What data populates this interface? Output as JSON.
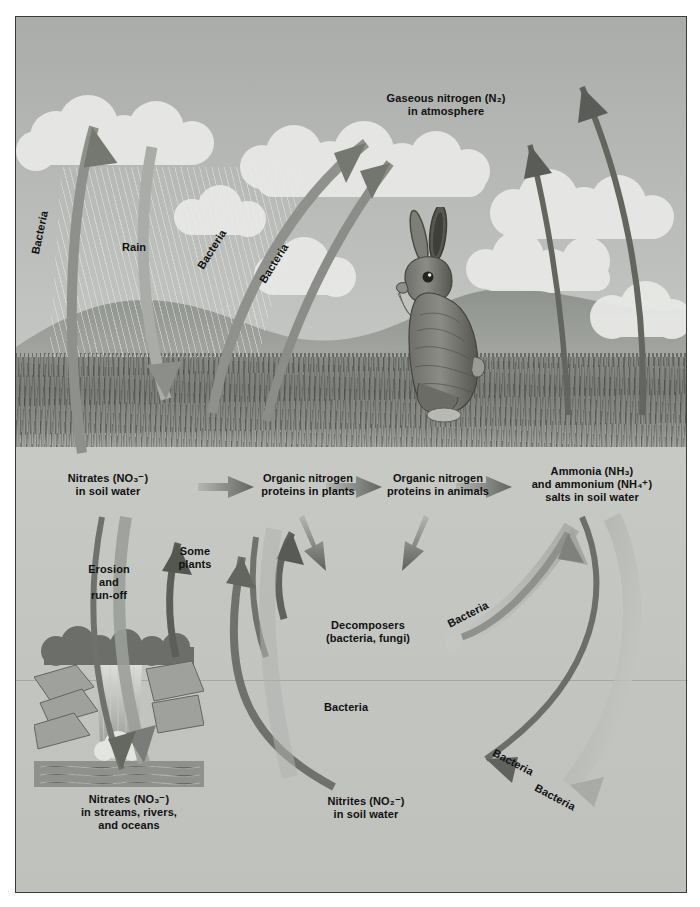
{
  "figure": {
    "background_color": "#bfc2be",
    "border_color": "#3c3c3c"
  },
  "pools": {
    "atmosphere": "Gaseous nitrogen (N₂)\nin atmosphere",
    "nitrates_soil": "Nitrates (NO₃⁻)\nin soil water",
    "organic_plants": "Organic nitrogen\nproteins in plants",
    "organic_animals": "Organic nitrogen\nproteins in animals",
    "ammonia": "Ammonia (NH₃)\nand ammonium (NH₄⁺)\nsalts in soil water",
    "decomposers": "Decomposers\n(bacteria, fungi)",
    "nitrates_water": "Nitrates (NO₃⁻)\nin streams, rivers,\nand oceans",
    "nitrites_soil": "Nitrites (NO₂⁻)\nin soil water"
  },
  "process_labels": {
    "bacteria": "Bacteria",
    "rain": "Rain",
    "erosion": "Erosion\nand\nrun-off",
    "some_plants": "Some\nplants"
  },
  "bacteria_instances": [
    {
      "id": "denitrification-left",
      "text": "Bacteria",
      "x": 24,
      "y": 215,
      "rotation": -78
    },
    {
      "id": "fixation-mid-left",
      "text": "Bacteria",
      "x": 196,
      "y": 232,
      "rotation": -58
    },
    {
      "id": "fixation-mid-right",
      "text": "Bacteria",
      "x": 258,
      "y": 246,
      "rotation": -58
    },
    {
      "id": "ammonification-right",
      "text": "Bacteria",
      "x": 452,
      "y": 597,
      "rotation": -27
    },
    {
      "id": "nitrification-lower",
      "text": "Bacteria",
      "x": 330,
      "y": 690,
      "rotation": 0
    },
    {
      "id": "nitrification-upper-r",
      "text": "Bacteria",
      "x": 497,
      "y": 745,
      "rotation": 28
    },
    {
      "id": "nitrification-lower-r",
      "text": "Bacteria",
      "x": 539,
      "y": 780,
      "rotation": 28
    }
  ],
  "scene": {
    "animal": "rabbit",
    "features": [
      "clouds",
      "rolling-hills",
      "grass-field",
      "rain-streaks",
      "waterfall",
      "rocky-cliffs",
      "trees",
      "stream"
    ]
  },
  "colors": {
    "arrow_dark": "#6b6e69",
    "arrow_mid": "#8d908b",
    "arrow_light": "#aeb1ac",
    "text": "#111111",
    "sky": "#b4b7b3",
    "ground": "#c3c5c1"
  }
}
